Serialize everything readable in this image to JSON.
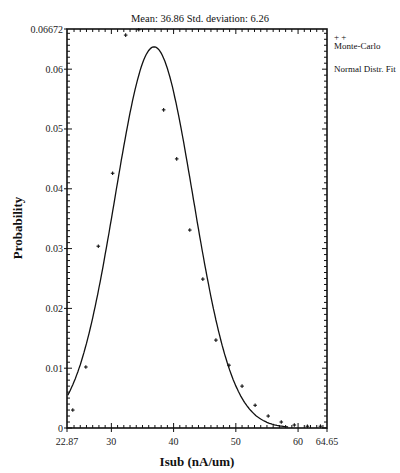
{
  "chart_data": {
    "type": "scatter",
    "title": "Mean: 36.86  Std. deviation:  6.26",
    "title_parts": {
      "mean_label": "Mean:",
      "mean": 36.86,
      "std_label": "Std. deviation:",
      "std": 6.26
    },
    "xlabel": "Isub (nA/um)",
    "ylabel": "Probability",
    "xlim": [
      22.87,
      64.65
    ],
    "ylim": [
      0,
      0.06672
    ],
    "x_ticks": [
      22.87,
      30,
      40,
      50,
      60,
      64.65
    ],
    "x_tick_labels": [
      "22.87",
      "30",
      "40",
      "50",
      "60",
      "64.65"
    ],
    "y_ticks": [
      0,
      0.01,
      0.02,
      0.03,
      0.04,
      0.05,
      0.06,
      0.06672
    ],
    "y_tick_labels": [
      "0",
      "0.01",
      "0.02",
      "0.03",
      "0.04",
      "0.05",
      "0.06",
      "0.06672"
    ],
    "grid": false,
    "legend_position": "right-top",
    "legend": [
      {
        "label": "Monte-Carlo",
        "marker": "+"
      },
      {
        "label": "Normal Distr. Fit",
        "marker": "line"
      }
    ],
    "series": [
      {
        "name": "Monte-Carlo",
        "type": "scatter",
        "x": [
          23.8,
          25.9,
          27.9,
          30.2,
          32.3,
          34.4,
          38.4,
          40.5,
          42.6,
          44.7,
          46.8,
          48.9,
          51.0,
          53.1,
          55.2,
          57.3,
          59.4,
          61.5,
          63.6
        ],
        "y": [
          0.003,
          0.0102,
          0.0304,
          0.0426,
          0.0657,
          0.0666,
          0.0532,
          0.045,
          0.0331,
          0.0249,
          0.0147,
          0.0105,
          0.007,
          0.0038,
          0.002,
          0.001,
          0.0005,
          0.0003,
          0.0003
        ]
      },
      {
        "name": "Normal Distr. Fit",
        "type": "line",
        "mean": 36.86,
        "std": 6.26,
        "peak": 0.0637
      }
    ]
  }
}
